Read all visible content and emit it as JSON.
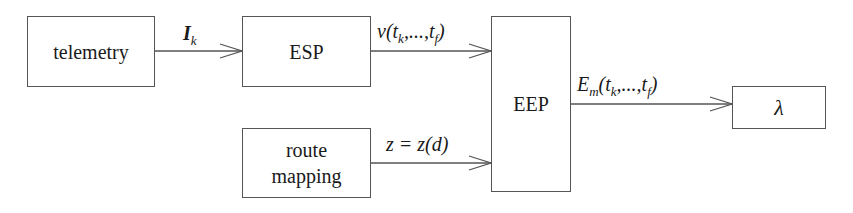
{
  "diagram": {
    "nodes": [
      {
        "id": "telemetry",
        "label": "telemetry"
      },
      {
        "id": "esp",
        "label": "ESP"
      },
      {
        "id": "route_mapping",
        "label_lines": [
          "route",
          "mapping"
        ]
      },
      {
        "id": "eep",
        "label": "EEP"
      },
      {
        "id": "lambda",
        "label": "λ"
      }
    ],
    "edges": [
      {
        "from": "telemetry",
        "to": "esp",
        "label_main": "I",
        "label_sub": "k"
      },
      {
        "from": "esp",
        "to": "eep",
        "label_parts": [
          "v(t",
          "k",
          ",...,t",
          "f",
          ")"
        ]
      },
      {
        "from": "route_mapping",
        "to": "eep",
        "label": "z = z(d)"
      },
      {
        "from": "eep",
        "to": "lambda",
        "label_parts": [
          "E",
          "m",
          "(t",
          "k",
          ",...,t",
          "f",
          ")"
        ]
      }
    ],
    "colors": {
      "line": "#555555",
      "text": "#1a1a1a",
      "background": "#ffffff"
    }
  }
}
